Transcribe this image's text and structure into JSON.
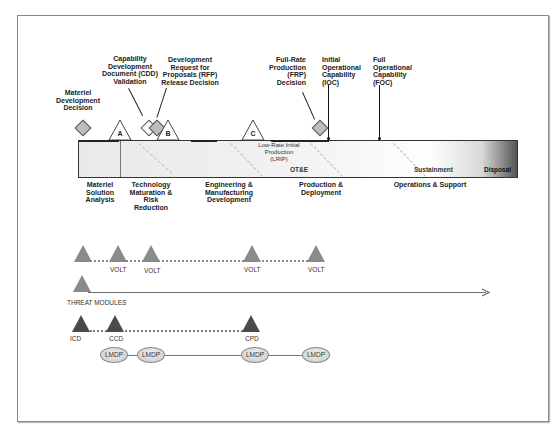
{
  "diagram": {
    "milestones": {
      "material_development_decision": "Materiel\nDevelopment\nDecision",
      "cdd_validation": "Capability\nDevelopment\nDocument (CDD)\nValidation",
      "rfp_release": "Development\nRequest for\nProposals (RFP)\nRelease Decision",
      "frp_decision": "Full-Rate\nProduction\n(FRP)\nDecision",
      "ioc": "Initial\nOperational\nCapability\n(IOC)",
      "foc": "Full\nOperational\nCapability\n(FOC)",
      "a": "A",
      "b": "B",
      "c": "C"
    },
    "bar_labels": {
      "lrip": "Low-Rate Initial\nProduction\n(LRIP)",
      "otse": "OT&E",
      "sustainment": "Sustainment",
      "disposal": "Disposal"
    },
    "phases": {
      "msa": "Materiel\nSolution\nAnalysis",
      "tmrr": "Technology\nMaturation &\nRisk\nReduction",
      "emd": "Engineering &\nManufacturing\nDevelopment",
      "pd": "Production &\nDeployment",
      "os": "Operations & Support"
    },
    "volt_row": {
      "labels": [
        "VOLT",
        "VOLT",
        "VOLT",
        "VOLT"
      ]
    },
    "threat_row": {
      "label": "THREAT MODULES"
    },
    "req_row": {
      "labels": [
        "ICD",
        "CCD",
        "CPD"
      ]
    },
    "lmdp_row": {
      "labels": [
        "LMDP",
        "LMDP",
        "LMDP",
        "LMDP"
      ]
    },
    "colors": {
      "volt_triangle": "#8a8a8a",
      "req_triangle": "#4a4a4a",
      "frame_border": "#8a8a8a"
    }
  }
}
